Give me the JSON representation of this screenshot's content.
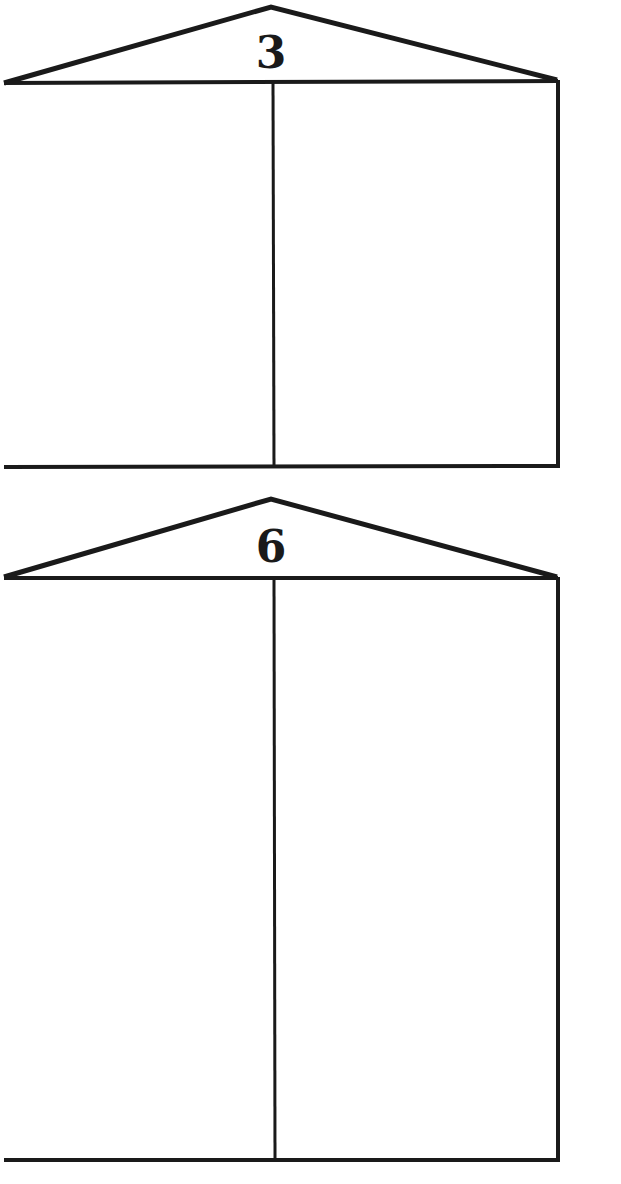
{
  "worksheet": {
    "type": "number-bond houses",
    "houses": [
      {
        "roof_number": "3",
        "left_cell": "",
        "right_cell": ""
      },
      {
        "roof_number": "6",
        "left_cell": "",
        "right_cell": ""
      }
    ],
    "colors": {
      "line": "#1a1a1a",
      "background": "#ffffff"
    }
  }
}
